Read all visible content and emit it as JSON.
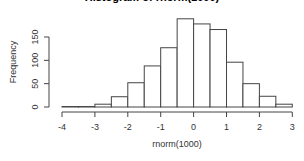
{
  "chart_data": {
    "type": "bar",
    "title": "Histogram of rnorm(1000)",
    "xlabel": "rnorm(1000)",
    "ylabel": "Frequency",
    "bin_edges": [
      -4,
      -3.5,
      -3,
      -2.5,
      -2,
      -1.5,
      -1,
      -0.5,
      0,
      0.5,
      1,
      1.5,
      2,
      2.5,
      3
    ],
    "categories": [
      "-4 to -3.5",
      "-3.5 to -3",
      "-3 to -2.5",
      "-2.5 to -2",
      "-2 to -1.5",
      "-1.5 to -1",
      "-1 to -0.5",
      "-0.5 to 0",
      "0 to 0.5",
      "0.5 to 1",
      "1 to 1.5",
      "1.5 to 2",
      "2 to 2.5",
      "2.5 to 3"
    ],
    "values": [
      1,
      1,
      6,
      22,
      52,
      88,
      127,
      189,
      178,
      166,
      96,
      50,
      23,
      6
    ],
    "xlim": [
      -4,
      3
    ],
    "ylim": [
      0,
      190
    ],
    "x_ticks": [
      -4,
      -3,
      -2,
      -1,
      0,
      1,
      2,
      3
    ],
    "y_ticks": [
      0,
      50,
      100,
      150
    ],
    "grid": false,
    "legend": null
  }
}
